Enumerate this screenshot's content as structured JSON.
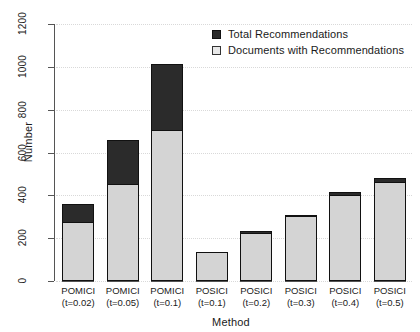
{
  "chart_data": {
    "type": "bar",
    "subtype": "stacked-overlay",
    "title": "",
    "xlabel": "Method",
    "ylabel": "Number",
    "ylim": [
      0,
      1200
    ],
    "yticks": [
      0,
      200,
      400,
      600,
      800,
      1000,
      1200
    ],
    "ytick_labels": [
      "0",
      "200",
      "400",
      "600",
      "800",
      "1000",
      "1200"
    ],
    "grid": true,
    "grid_axis": "y",
    "legend_position": "top-right",
    "categories": [
      "POMICI (t=0.02)",
      "POMICI (t=0.05)",
      "POMICI (t=0.1)",
      "POSICI (t=0.1)",
      "POSICI (t=0.2)",
      "POSICI (t=0.3)",
      "POSICI (t=0.4)",
      "POSICI (t=0.5)"
    ],
    "category_lines": [
      [
        "POMICI",
        "(t=0.02)"
      ],
      [
        "POMICI",
        "(t=0.05)"
      ],
      [
        "POMICI",
        "(t=0.1)"
      ],
      [
        "POSICI",
        "(t=0.1)"
      ],
      [
        "POSICI",
        "(t=0.2)"
      ],
      [
        "POSICI",
        "(t=0.3)"
      ],
      [
        "POSICI",
        "(t=0.4)"
      ],
      [
        "POSICI",
        "(t=0.5)"
      ]
    ],
    "series": [
      {
        "name": "Total Recommendations",
        "color": "#2b2b2b",
        "values": [
          360,
          658,
          1013,
          137,
          233,
          308,
          415,
          481
        ]
      },
      {
        "name": "Documents with Recommendations",
        "color": "#d4d4d4",
        "values": [
          275,
          453,
          705,
          135,
          223,
          302,
          403,
          462
        ]
      }
    ]
  },
  "legend": {
    "items": [
      {
        "label": "Total Recommendations",
        "swatch": "filled"
      },
      {
        "label": "Documents with Recommendations",
        "swatch": "open"
      }
    ]
  },
  "axes": {
    "y_title": "Number",
    "x_title": "Method"
  },
  "colors": {
    "total": "#2b2b2b",
    "documents": "#d4d4d4",
    "axis": "#555555",
    "grid": "#d9d9d9",
    "background": "#ffffff"
  }
}
